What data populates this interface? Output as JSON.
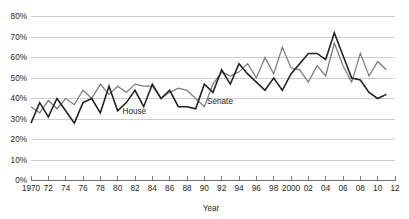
{
  "chart_data": {
    "type": "line",
    "title": "",
    "subtitle": "",
    "xlabel": "Year",
    "ylabel": "",
    "xlim": [
      1970,
      2012
    ],
    "ylim": [
      0,
      0.8
    ],
    "grid": true,
    "legend_position": "inline-annotation",
    "y_tick_labels": [
      "0%",
      "10%",
      "20%",
      "30%",
      "40%",
      "50%",
      "60%",
      "70%",
      "80%"
    ],
    "y_tick_values": [
      0,
      10,
      20,
      30,
      40,
      50,
      60,
      70,
      80
    ],
    "x_tick_labels": [
      "1970",
      "72",
      "74",
      "76",
      "78",
      "80",
      "82",
      "84",
      "86",
      "88",
      "90",
      "92",
      "94",
      "96",
      "98",
      "2000",
      "02",
      "04",
      "06",
      "08",
      "10",
      "12"
    ],
    "x_tick_values": [
      1970,
      1972,
      1974,
      1976,
      1978,
      1980,
      1982,
      1984,
      1986,
      1988,
      1990,
      1992,
      1994,
      1996,
      1998,
      2000,
      2002,
      2004,
      2006,
      2008,
      2010,
      2012
    ],
    "x": [
      1970,
      1971,
      1972,
      1973,
      1974,
      1975,
      1976,
      1977,
      1978,
      1979,
      1980,
      1981,
      1982,
      1983,
      1984,
      1985,
      1986,
      1987,
      1988,
      1989,
      1990,
      1991,
      1992,
      1993,
      1994,
      1995,
      1996,
      1997,
      1998,
      1999,
      2000,
      2001,
      2002,
      2003,
      2004,
      2005,
      2006,
      2007,
      2008,
      2009,
      2010,
      2011
    ],
    "series": [
      {
        "name": "House",
        "color": "#231f20",
        "annotation": "House",
        "values": [
          28,
          38,
          31,
          40,
          34,
          28,
          38,
          40,
          33,
          46,
          34,
          38,
          44,
          36,
          47,
          40,
          44,
          36,
          36,
          35,
          47,
          43,
          54,
          47,
          57,
          52,
          48,
          44,
          50,
          44,
          52,
          57,
          62,
          62,
          59,
          72,
          61,
          50,
          49,
          43,
          40,
          42
        ]
      },
      {
        "name": "Senate",
        "color": "#7b7b7b",
        "annotation": "Senate",
        "values": [
          36,
          33,
          39,
          35,
          40,
          37,
          44,
          40,
          47,
          42,
          46,
          43,
          47,
          46,
          46,
          40,
          43,
          45,
          44,
          40,
          36,
          47,
          53,
          51,
          53,
          57,
          50,
          60,
          52,
          65,
          55,
          54,
          48,
          56,
          51,
          67,
          56,
          48,
          62,
          51,
          58,
          54
        ]
      }
    ],
    "annotations": [
      {
        "text": "House",
        "series": "House"
      },
      {
        "text": "Senate",
        "series": "Senate"
      }
    ]
  },
  "colors": {
    "house": "#231f20",
    "senate": "#7b7b7b",
    "grid": "#b9b9b9",
    "axis": "#6f6f6f",
    "text": "#231f20",
    "background": "#ffffff"
  }
}
